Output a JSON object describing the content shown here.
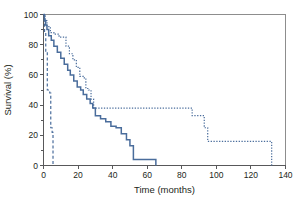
{
  "chart_data": {
    "type": "line",
    "title": "",
    "subtitle": "",
    "xlabel": "Time (months)",
    "ylabel": "Survival (%)",
    "xlim": [
      0,
      140
    ],
    "ylim": [
      0,
      100
    ],
    "xticks": [
      0,
      20,
      40,
      60,
      80,
      100,
      120,
      140
    ],
    "yticks": [
      0,
      20,
      40,
      60,
      80,
      100
    ],
    "xtick_labels": [
      "0",
      "20",
      "40",
      "60",
      "80",
      "100",
      "120",
      "140"
    ],
    "ytick_labels": [
      "0",
      "20",
      "40",
      "60",
      "80",
      "100"
    ],
    "grid": false,
    "legend": "none",
    "line_color": "#4a6d9c",
    "frame_color": "#8d8d8d",
    "axis_color": "#58585a",
    "series": [
      {
        "name": "solid-curve",
        "style": "solid",
        "color": "#4a6d9c",
        "x": [
          0,
          0.5,
          0.5,
          1.2,
          1.2,
          2.0,
          2.0,
          3.0,
          3.0,
          4.5,
          4.5,
          6.0,
          6.0,
          8.0,
          8.0,
          10.0,
          10.0,
          12.0,
          12.0,
          14.0,
          14.0,
          15.5,
          15.5,
          17.5,
          17.5,
          19.5,
          19.5,
          21.5,
          21.5,
          23.0,
          23.0,
          25.0,
          25.0,
          27.0,
          27.0,
          28.5,
          28.5,
          30.0,
          30.0,
          33.0,
          33.0,
          36.0,
          36.0,
          39.0,
          39.0,
          42.0,
          42.0,
          45.0,
          45.0,
          48.0,
          48.0,
          50.0,
          50.0,
          52.0,
          52.0,
          65.0,
          65.0
        ],
        "y": [
          100,
          100,
          96,
          96,
          93,
          93,
          90,
          90,
          86,
          86,
          83,
          83,
          79,
          79,
          75,
          75,
          71,
          71,
          67,
          67,
          63,
          63,
          60,
          60,
          56,
          56,
          52,
          52,
          50,
          50,
          47,
          47,
          44,
          44,
          41,
          41,
          38,
          38,
          33,
          33,
          31,
          31,
          29,
          29,
          26,
          26,
          25,
          25,
          21,
          21,
          17,
          17,
          13,
          13,
          4,
          4,
          0
        ]
      },
      {
        "name": "dotted-curve",
        "style": "dotted",
        "color": "#4a6d9c",
        "x": [
          0,
          1.0,
          1.0,
          2.0,
          2.0,
          4.0,
          4.0,
          6.0,
          6.0,
          9.0,
          9.0,
          13.0,
          13.0,
          15.0,
          15.0,
          17.0,
          17.0,
          19.0,
          19.0,
          21.0,
          21.0,
          23.0,
          23.0,
          24.5,
          24.5,
          26.0,
          26.0,
          27.5,
          27.5,
          29.0,
          29.0,
          50.0,
          50.0,
          86.0,
          86.0,
          93.0,
          93.0,
          95.0,
          95.0,
          132.0,
          132.0
        ],
        "y": [
          100,
          100,
          96,
          96,
          92,
          92,
          88,
          88,
          87,
          87,
          85,
          85,
          79,
          79,
          74,
          74,
          70,
          70,
          65,
          65,
          59,
          59,
          58,
          58,
          51,
          51,
          50,
          50,
          44,
          44,
          38,
          38,
          38,
          38,
          33,
          33,
          25,
          25,
          16,
          16,
          0
        ]
      },
      {
        "name": "dashed-curve",
        "style": "dashed",
        "color": "#4a6d9c",
        "x": [
          0,
          0.6,
          0.6,
          1.3,
          1.3,
          2.2,
          2.2,
          3.6,
          3.6,
          4.2,
          4.2,
          5.0,
          5.0,
          5.5,
          5.5
        ],
        "y": [
          100,
          100,
          88,
          88,
          75,
          75,
          50,
          50,
          48,
          48,
          25,
          25,
          22,
          22,
          0
        ]
      }
    ]
  },
  "axes": {
    "x_title": "Time (months)",
    "y_title": "Survival (%)"
  }
}
